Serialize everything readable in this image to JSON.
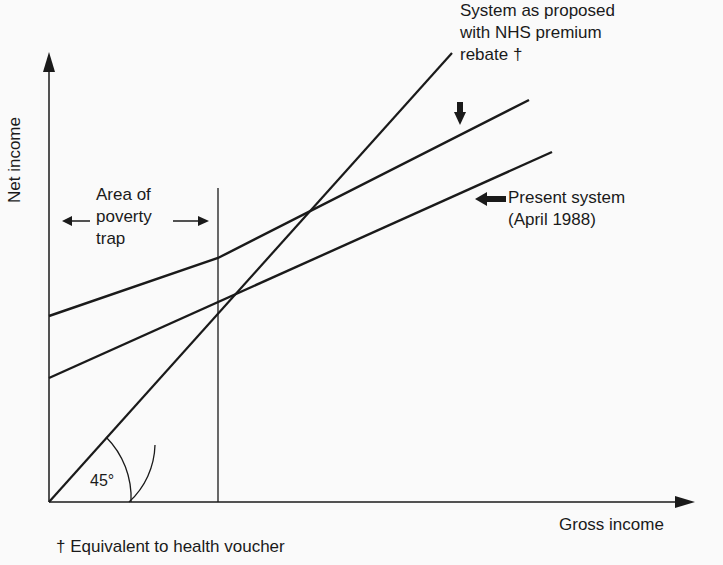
{
  "diagram": {
    "type": "income line diagram",
    "axes": {
      "x_label": "Gross income",
      "y_label": "Net income"
    },
    "annotations": {
      "proposed_system": {
        "lines": [
          "System as proposed",
          "with NHS premium",
          "rebate †"
        ]
      },
      "present_system": {
        "lines": [
          "Present system",
          "(April 1988)"
        ]
      },
      "poverty_trap": {
        "lines": [
          "Area of",
          "poverty",
          "trap"
        ]
      },
      "angle": "45°"
    },
    "footnote": "† Equivalent to health voucher",
    "series": [
      {
        "name": "45-degree line (net = gross)",
        "shape": "straight line from origin at 45 degrees"
      },
      {
        "name": "System as proposed with NHS premium rebate",
        "shape": "starts highest on y-axis, kinks upward at end of poverty trap area, gentler slope after"
      },
      {
        "name": "Present system (April 1988)",
        "shape": "starts lower on y-axis, shallow slope, meets 45-degree line at end of poverty trap area"
      }
    ],
    "colors": {
      "ink": "#1a1a1a",
      "background": "#fafafa"
    }
  }
}
